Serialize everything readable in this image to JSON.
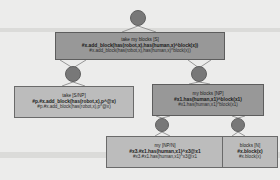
{
  "diagram": {
    "background_color": "#ececeb",
    "node_color": "#787878",
    "box_dark_color": "#989898",
    "box_light_color": "#bcbcbc",
    "edge_color": "#8c8c8c"
  },
  "nodes": [
    {
      "id": "root",
      "name": "root-node",
      "shape": "circle",
      "x": 138,
      "y": 18,
      "r": 8
    },
    {
      "id": "take-op",
      "name": "take-operator-node",
      "shape": "circle",
      "x": 73,
      "y": 74,
      "r": 8
    },
    {
      "id": "myblocks-op",
      "name": "my-blocks-operator-node",
      "shape": "circle",
      "x": 199,
      "y": 74,
      "r": 8
    },
    {
      "id": "my-op",
      "name": "my-operator-node",
      "shape": "circle",
      "x": 162,
      "y": 125,
      "r": 7
    },
    {
      "id": "blocks-op",
      "name": "blocks-operator-node",
      "shape": "circle",
      "x": 238,
      "y": 125,
      "r": 7
    }
  ],
  "boxes": [
    {
      "id": "s-box",
      "name": "category-box-sentence",
      "style": "dark",
      "x": 55,
      "y": 32,
      "w": 170,
      "h": 28,
      "phrase": "take my blocks [S]",
      "logic_bold": "#x.add_block(has(robot,x),has(human,x)^block(x))",
      "logic_plain": "#x.add_block(has(robot,x),has(human,x)^block(x))"
    },
    {
      "id": "take-box",
      "name": "category-box-take",
      "style": "light",
      "x": 14,
      "y": 86,
      "w": 120,
      "h": 32,
      "phrase": "take [S/NP]",
      "logic_bold": "#p.#x.add_block(has(robot,x),p^@x)",
      "logic_plain": "#p.#x.add_block(has(robot,x),p^@x)"
    },
    {
      "id": "np-box",
      "name": "category-box-my-blocks",
      "style": "dark",
      "x": 152,
      "y": 84,
      "w": 112,
      "h": 32,
      "phrase": "my blocks [NP]",
      "logic_bold": "#x1.has(human,x1)^block(x1)",
      "logic_plain": "#x1.has(human,x1)^block(x1)"
    },
    {
      "id": "my-box",
      "name": "category-box-my",
      "style": "light",
      "x": 106,
      "y": 136,
      "w": 118,
      "h": 32,
      "phrase": "my [NP/N]",
      "logic_bold": "#x3.#x1.has(human,x1)^x3@x1",
      "logic_plain": "#x3.#x1.has(human,x1)^x3@x1"
    },
    {
      "id": "blocks-box",
      "name": "category-box-blocks",
      "style": "light",
      "x": 222,
      "y": 136,
      "w": 56,
      "h": 32,
      "phrase": "blocks [N]",
      "logic_bold": "#x.block(x)",
      "logic_plain": "#x.block(x)"
    }
  ]
}
